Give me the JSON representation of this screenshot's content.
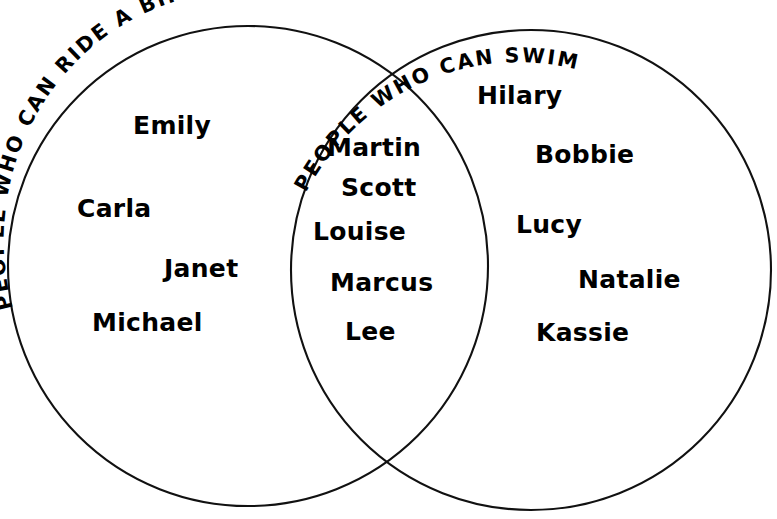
{
  "diagram": {
    "type": "venn",
    "title_left": "PEOPLE WHO CAN RIDE A BIKE",
    "title_right": "PEOPLE WHO CAN SWIM",
    "stroke_color": "#111111",
    "text_color": "#000000",
    "background_color": "#ffffff",
    "left_set": {
      "label": "PEOPLE WHO CAN RIDE A BIKE",
      "only_members": [
        "Emily",
        "Carla",
        "Janet",
        "Michael"
      ]
    },
    "right_set": {
      "label": "PEOPLE WHO CAN SWIM",
      "only_members": [
        "Hilary",
        "Bobbie",
        "Lucy",
        "Natalie",
        "Kassie"
      ]
    },
    "intersection": {
      "members": [
        "Martin",
        "Scott",
        "Louise",
        "Marcus",
        "Lee"
      ]
    }
  },
  "names": {
    "left": [
      {
        "text": "Emily",
        "x": 133,
        "y": 113
      },
      {
        "text": "Carla",
        "x": 77,
        "y": 196
      },
      {
        "text": "Janet",
        "x": 164,
        "y": 256
      },
      {
        "text": "Michael",
        "x": 92,
        "y": 310
      }
    ],
    "middle": [
      {
        "text": "Martin",
        "x": 327,
        "y": 135
      },
      {
        "text": "Scott",
        "x": 341,
        "y": 175
      },
      {
        "text": "Louise",
        "x": 313,
        "y": 219
      },
      {
        "text": "Marcus",
        "x": 330,
        "y": 270
      },
      {
        "text": "Lee",
        "x": 345,
        "y": 319
      }
    ],
    "right": [
      {
        "text": "Hilary",
        "x": 477,
        "y": 83
      },
      {
        "text": "Bobbie",
        "x": 535,
        "y": 142
      },
      {
        "text": "Lucy",
        "x": 516,
        "y": 212
      },
      {
        "text": "Natalie",
        "x": 578,
        "y": 267
      },
      {
        "text": "Kassie",
        "x": 536,
        "y": 320
      }
    ]
  }
}
